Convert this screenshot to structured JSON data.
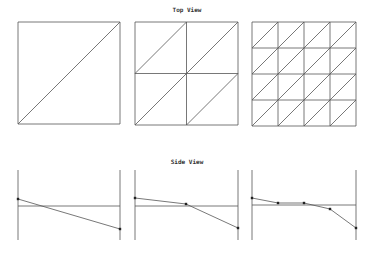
{
  "top_view": {
    "title": "Top View",
    "panels": [
      {
        "x": 18,
        "y": 22,
        "size": 102,
        "divisions": 1
      },
      {
        "x": 135,
        "y": 22,
        "size": 103,
        "divisions": 2
      },
      {
        "x": 252,
        "y": 22,
        "size": 104,
        "divisions": 4
      }
    ]
  },
  "side_view": {
    "title": "Side View",
    "panels": [
      {
        "x0": 18,
        "x1": 120,
        "baseline": 206,
        "points": [
          [
            18,
            199
          ],
          [
            120,
            229
          ]
        ]
      },
      {
        "x0": 135,
        "x1": 238,
        "baseline": 206,
        "points": [
          [
            135,
            198
          ],
          [
            186,
            204
          ],
          [
            238,
            228
          ]
        ]
      },
      {
        "x0": 252,
        "x1": 356,
        "baseline": 205,
        "points": [
          [
            252,
            198
          ],
          [
            278,
            203
          ],
          [
            304,
            203
          ],
          [
            330,
            209
          ],
          [
            356,
            228
          ]
        ]
      }
    ],
    "vertical_top": 170,
    "vertical_bottom": 240
  },
  "colors": {
    "line": "#555555",
    "point": "#222222"
  }
}
